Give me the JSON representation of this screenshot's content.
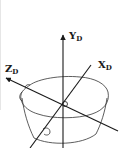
{
  "diagram": {
    "type": "3d-coordinate-frame-on-object",
    "object": "bowl",
    "axes": [
      {
        "name": "Y",
        "subscript": "D",
        "direction": "up"
      },
      {
        "name": "X",
        "subscript": "D",
        "direction": "upper-right"
      },
      {
        "name": "Z",
        "subscript": "D",
        "direction": "upper-left"
      }
    ],
    "labels": {
      "y_main": "Y",
      "y_sub": "D",
      "x_main": "X",
      "x_sub": "D",
      "z_main": "Z",
      "z_sub": "D"
    },
    "colors": {
      "line": "#1a1a1a",
      "background": "#ffffff"
    }
  }
}
